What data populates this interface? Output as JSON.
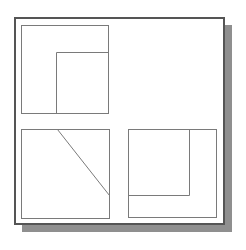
{
  "diagram": {
    "frame": {
      "x": 14,
      "y": 17,
      "w": 211,
      "h": 208,
      "stroke": "#555555",
      "shadow": "#8f8f8f"
    },
    "stroke_color": "#7a7a7a",
    "panels": [
      {
        "name": "top-left-panel",
        "box": {
          "x": 21,
          "y": 25,
          "w": 87,
          "h": 88
        },
        "lines": [
          {
            "x1": 56,
            "y1": 52,
            "x2": 108,
            "y2": 52
          },
          {
            "x1": 56,
            "y1": 52,
            "x2": 56,
            "y2": 113
          }
        ]
      },
      {
        "name": "bottom-left-panel",
        "box": {
          "x": 21,
          "y": 129,
          "w": 88,
          "h": 89
        },
        "lines": [
          {
            "x1": 57,
            "y1": 129,
            "x2": 109,
            "y2": 195
          }
        ]
      },
      {
        "name": "bottom-right-panel",
        "box": {
          "x": 128,
          "y": 129,
          "w": 88,
          "h": 88
        },
        "lines": [
          {
            "x1": 189,
            "y1": 129,
            "x2": 189,
            "y2": 195
          },
          {
            "x1": 128,
            "y1": 195,
            "x2": 189,
            "y2": 195
          }
        ]
      }
    ]
  }
}
